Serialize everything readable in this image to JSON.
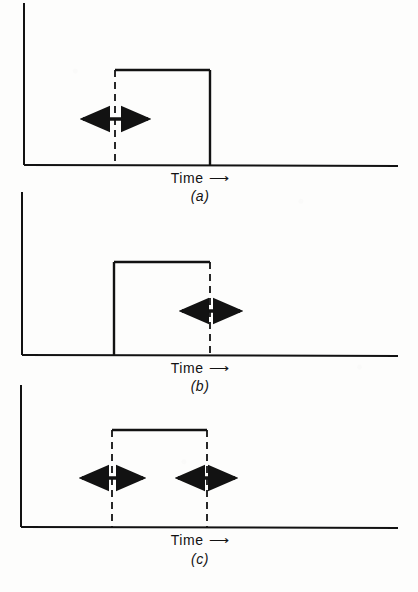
{
  "figure": {
    "kind": "pulse-timing-diagram",
    "background_color": "#fdfdfc",
    "ink_color": "#121212",
    "width": 418,
    "height": 592
  },
  "panels": [
    {
      "id": "a",
      "letter": "(a)",
      "axis_label": "Time",
      "axis_arrow_glyph": "⟶",
      "description": "Pulse with dashed rising edge and solid falling edge; double-headed arrow straddles the rising edge",
      "geometry": {
        "y_axis_x": 24,
        "y_axis_top": 3,
        "baseline_y": 165,
        "baseline_x_end": 398,
        "pulse_top_y": 70,
        "rise_x": 115,
        "fall_x": 210,
        "rise_edge_style": "dashed",
        "fall_edge_style": "solid"
      },
      "arrows": [
        {
          "name": "rise-edge-jitter-arrow",
          "x_start": 83,
          "x_end": 148,
          "y": 119
        }
      ],
      "label_positions": {
        "time_y": 172,
        "letter_y": 190,
        "center_x": 200
      }
    },
    {
      "id": "b",
      "letter": "(b)",
      "axis_label": "Time",
      "axis_arrow_glyph": "⟶",
      "description": "Pulse with solid rising edge and dashed falling edge; double-headed arrow straddles the falling edge",
      "geometry": {
        "y_axis_x": 22,
        "y_axis_top": 192,
        "baseline_y": 355,
        "baseline_x_end": 398,
        "pulse_top_y": 262,
        "rise_x": 114,
        "fall_x": 210,
        "rise_edge_style": "solid",
        "fall_edge_style": "dashed"
      },
      "arrows": [
        {
          "name": "fall-edge-jitter-arrow",
          "x_start": 182,
          "x_end": 240,
          "y": 311
        }
      ],
      "label_positions": {
        "time_y": 362,
        "letter_y": 380,
        "center_x": 200
      }
    },
    {
      "id": "c",
      "letter": "(c)",
      "axis_label": "Time",
      "axis_arrow_glyph": "⟶",
      "description": "Pulse with both edges dashed; double-headed arrows straddle both the rising and falling edges",
      "geometry": {
        "y_axis_x": 21,
        "y_axis_top": 385,
        "baseline_y": 527,
        "baseline_x_end": 398,
        "pulse_top_y": 430,
        "rise_x": 112,
        "fall_x": 207,
        "rise_edge_style": "dashed",
        "fall_edge_style": "dashed"
      },
      "arrows": [
        {
          "name": "rise-edge-jitter-arrow",
          "x_start": 82,
          "x_end": 143,
          "y": 478
        },
        {
          "name": "fall-edge-jitter-arrow",
          "x_start": 178,
          "x_end": 235,
          "y": 478
        }
      ],
      "label_positions": {
        "time_y": 534,
        "letter_y": 553,
        "center_x": 200
      }
    }
  ]
}
